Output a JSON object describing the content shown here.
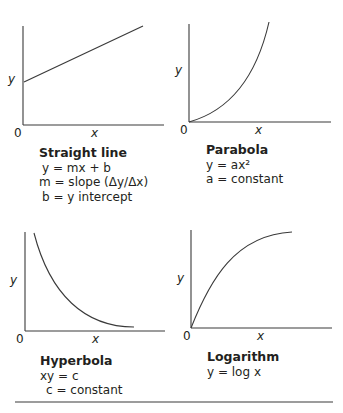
{
  "figure": {
    "top_cutoff_text": "",
    "panels": [
      {
        "id": "straight-line",
        "title": "Straight line",
        "lines": [
          "y = mx + b",
          "m = slope (Δy/Δx)",
          "b = y intercept"
        ],
        "axis": {
          "x_label": "x",
          "y_label": "y",
          "origin_label": "0"
        }
      },
      {
        "id": "parabola",
        "title": "Parabola",
        "lines": [
          "y = ax²",
          "a = constant"
        ],
        "axis": {
          "x_label": "x",
          "y_label": "y",
          "origin_label": "0"
        }
      },
      {
        "id": "hyperbola",
        "title": "Hyperbola",
        "lines": [
          "xy = c",
          "c = constant"
        ],
        "axis": {
          "x_label": "x",
          "y_label": "y",
          "origin_label": "0"
        }
      },
      {
        "id": "logarithm",
        "title": "Logarithm",
        "lines": [
          "y = log x"
        ],
        "axis": {
          "x_label": "x",
          "y_label": "y",
          "origin_label": "0"
        }
      }
    ],
    "colors": {
      "line": "#3a3a3a",
      "text": "#231f20"
    }
  }
}
